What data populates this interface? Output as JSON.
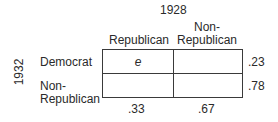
{
  "col_group_label": "1928",
  "row_group_label": "1932",
  "columns": [
    {
      "label_line1": "",
      "label_line2": "Republican",
      "marginal": ".33"
    },
    {
      "label_line1": "Non-",
      "label_line2": "Republican",
      "marginal": ".67"
    }
  ],
  "rows": [
    {
      "label_line1": "Democrat",
      "label_line2": "",
      "marginal": ".23"
    },
    {
      "label_line1": "Non-",
      "label_line2": "Republican",
      "marginal": ".78"
    }
  ],
  "cells": [
    [
      "e",
      ""
    ],
    [
      "",
      ""
    ]
  ]
}
